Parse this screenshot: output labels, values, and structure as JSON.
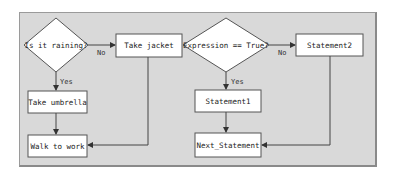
{
  "diagram": {
    "type": "flowchart",
    "colors": {
      "panel_background": "#d9d9d9",
      "node_fill": "#ffffff",
      "node_stroke": "#555555",
      "edge_stroke": "#444444"
    },
    "left_flowchart": {
      "decision": {
        "label": "Is it raining?"
      },
      "no_action": {
        "label": "Take jacket"
      },
      "yes_action": {
        "label": "Take umbrella"
      },
      "end": {
        "label": "Walk to work"
      },
      "edges": {
        "yes_label": "Yes",
        "no_label": "No"
      }
    },
    "right_flowchart": {
      "decision": {
        "label": "Expression == True?"
      },
      "no_action": {
        "label": "Statement2"
      },
      "yes_action": {
        "label": "Statement1"
      },
      "end": {
        "label": "Next_Statement"
      },
      "edges": {
        "yes_label": "Yes",
        "no_label": "No"
      }
    }
  }
}
